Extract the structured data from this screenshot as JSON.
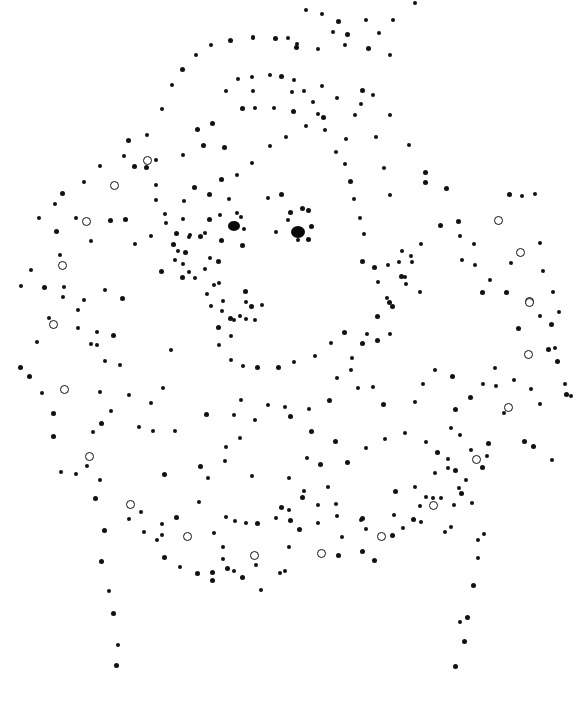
{
  "image": {
    "subject": "dot-art portrait with ruff collar",
    "background": "#fefefe",
    "ink": "#111111",
    "eyes": [
      {
        "x": 228,
        "y": 221,
        "w": 12,
        "h": 10
      },
      {
        "x": 291,
        "y": 226,
        "w": 14,
        "h": 12
      }
    ],
    "rings": [
      [
        147,
        160
      ],
      [
        114,
        185
      ],
      [
        86,
        221
      ],
      [
        62,
        265
      ],
      [
        53,
        324
      ],
      [
        64,
        389
      ],
      [
        89,
        456
      ],
      [
        130,
        504
      ],
      [
        187,
        536
      ],
      [
        254,
        555
      ],
      [
        321,
        553
      ],
      [
        381,
        536
      ],
      [
        433,
        505
      ],
      [
        476,
        459
      ],
      [
        508,
        407
      ],
      [
        528,
        354
      ],
      [
        529,
        301
      ],
      [
        529,
        302
      ],
      [
        520,
        252
      ],
      [
        498,
        220
      ]
    ],
    "dots": [
      [
        415,
        3
      ],
      [
        306,
        10
      ],
      [
        322,
        14
      ],
      [
        338,
        21
      ],
      [
        366,
        20
      ],
      [
        393,
        20
      ],
      [
        253,
        37
      ],
      [
        288,
        38
      ],
      [
        333,
        32
      ],
      [
        347,
        34
      ],
      [
        379,
        33
      ],
      [
        296,
        47
      ],
      [
        318,
        49
      ],
      [
        345,
        45
      ],
      [
        368,
        48
      ],
      [
        390,
        55
      ],
      [
        211,
        45
      ],
      [
        230,
        40
      ],
      [
        253,
        38
      ],
      [
        275,
        38
      ],
      [
        297,
        44
      ],
      [
        196,
        55
      ],
      [
        182,
        69
      ],
      [
        172,
        85
      ],
      [
        162,
        109
      ],
      [
        147,
        135
      ],
      [
        128,
        140
      ],
      [
        124,
        156
      ],
      [
        100,
        166
      ],
      [
        84,
        182
      ],
      [
        62,
        193
      ],
      [
        55,
        204
      ],
      [
        39,
        218
      ],
      [
        238,
        79
      ],
      [
        252,
        77
      ],
      [
        270,
        75
      ],
      [
        281,
        76
      ],
      [
        294,
        80
      ],
      [
        226,
        91
      ],
      [
        253,
        91
      ],
      [
        292,
        92
      ],
      [
        304,
        91
      ],
      [
        322,
        86
      ],
      [
        337,
        98
      ],
      [
        362,
        90
      ],
      [
        373,
        95
      ],
      [
        390,
        115
      ],
      [
        409,
        145
      ],
      [
        425,
        172
      ],
      [
        446,
        188
      ],
      [
        458,
        221
      ],
      [
        474,
        244
      ],
      [
        475,
        265
      ],
      [
        482,
        292
      ],
      [
        197,
        129
      ],
      [
        212,
        123
      ],
      [
        242,
        108
      ],
      [
        255,
        108
      ],
      [
        274,
        108
      ],
      [
        293,
        111
      ],
      [
        313,
        102
      ],
      [
        318,
        114
      ],
      [
        355,
        115
      ],
      [
        361,
        104
      ],
      [
        306,
        126
      ],
      [
        346,
        139
      ],
      [
        376,
        137
      ],
      [
        384,
        168
      ],
      [
        390,
        195
      ],
      [
        425,
        182
      ],
      [
        402,
        251
      ],
      [
        406,
        284
      ],
      [
        387,
        298
      ],
      [
        377,
        340
      ],
      [
        224,
        147
      ],
      [
        203,
        145
      ],
      [
        183,
        155
      ],
      [
        156,
        160
      ],
      [
        146,
        167
      ],
      [
        134,
        166
      ],
      [
        156,
        185
      ],
      [
        194,
        187
      ],
      [
        221,
        179
      ],
      [
        156,
        200
      ],
      [
        184,
        201
      ],
      [
        183,
        219
      ],
      [
        165,
        214
      ],
      [
        209,
        194
      ],
      [
        176,
        233
      ],
      [
        209,
        219
      ],
      [
        237,
        213
      ],
      [
        241,
        217
      ],
      [
        244,
        229
      ],
      [
        242,
        245
      ],
      [
        268,
        198
      ],
      [
        281,
        194
      ],
      [
        290,
        212
      ],
      [
        308,
        210
      ],
      [
        302,
        208
      ],
      [
        311,
        226
      ],
      [
        308,
        239
      ],
      [
        298,
        240
      ],
      [
        276,
        232
      ],
      [
        288,
        220
      ],
      [
        76,
        218
      ],
      [
        91,
        241
      ],
      [
        110,
        220
      ],
      [
        125,
        219
      ],
      [
        135,
        244
      ],
      [
        151,
        236
      ],
      [
        166,
        223
      ],
      [
        190,
        235
      ],
      [
        60,
        255
      ],
      [
        56,
        231
      ],
      [
        21,
        286
      ],
      [
        31,
        270
      ],
      [
        44,
        287
      ],
      [
        63,
        297
      ],
      [
        78,
        310
      ],
      [
        84,
        300
      ],
      [
        78,
        328
      ],
      [
        91,
        344
      ],
      [
        122,
        298
      ],
      [
        161,
        271
      ],
      [
        183,
        264
      ],
      [
        200,
        236
      ],
      [
        175,
        260
      ],
      [
        178,
        251
      ],
      [
        185,
        252
      ],
      [
        189,
        237
      ],
      [
        173,
        244
      ],
      [
        205,
        233
      ],
      [
        189,
        272
      ],
      [
        182,
        277
      ],
      [
        205,
        269
      ],
      [
        195,
        278
      ],
      [
        210,
        258
      ],
      [
        214,
        285
      ],
      [
        207,
        294
      ],
      [
        246,
        302
      ],
      [
        251,
        306
      ],
      [
        262,
        305
      ],
      [
        246,
        319
      ],
      [
        240,
        316
      ],
      [
        255,
        320
      ],
      [
        245,
        291
      ],
      [
        230,
        318
      ],
      [
        218,
        327
      ],
      [
        231,
        336
      ],
      [
        219,
        345
      ],
      [
        231,
        360
      ],
      [
        243,
        366
      ],
      [
        257,
        367
      ],
      [
        278,
        367
      ],
      [
        294,
        362
      ],
      [
        315,
        356
      ],
      [
        331,
        343
      ],
      [
        344,
        332
      ],
      [
        367,
        334
      ],
      [
        389,
        302
      ],
      [
        388,
        265
      ],
      [
        399,
        262
      ],
      [
        401,
        276
      ],
      [
        411,
        256
      ],
      [
        412,
        262
      ],
      [
        420,
        292
      ],
      [
        405,
        277
      ],
      [
        421,
        244
      ],
      [
        440,
        225
      ],
      [
        460,
        236
      ],
      [
        509,
        194
      ],
      [
        522,
        196
      ],
      [
        535,
        194
      ],
      [
        462,
        260
      ],
      [
        511,
        263
      ],
      [
        540,
        243
      ],
      [
        543,
        271
      ],
      [
        553,
        292
      ],
      [
        559,
        312
      ],
      [
        555,
        348
      ],
      [
        557,
        361
      ],
      [
        490,
        280
      ],
      [
        506,
        292
      ],
      [
        540,
        316
      ],
      [
        518,
        328
      ],
      [
        551,
        324
      ],
      [
        548,
        349
      ],
      [
        566,
        394
      ],
      [
        571,
        396
      ],
      [
        495,
        368
      ],
      [
        496,
        386
      ],
      [
        514,
        380
      ],
      [
        531,
        389
      ],
      [
        540,
        404
      ],
      [
        504,
        413
      ],
      [
        483,
        384
      ],
      [
        470,
        397
      ],
      [
        460,
        435
      ],
      [
        455,
        470
      ],
      [
        466,
        480
      ],
      [
        437,
        452
      ],
      [
        471,
        450
      ],
      [
        448,
        468
      ],
      [
        459,
        488
      ],
      [
        441,
        498
      ],
      [
        524,
        441
      ],
      [
        533,
        446
      ],
      [
        552,
        460
      ],
      [
        565,
        384
      ],
      [
        426,
        442
      ],
      [
        373,
        387
      ],
      [
        358,
        388
      ],
      [
        329,
        400
      ],
      [
        309,
        409
      ],
      [
        285,
        407
      ],
      [
        268,
        405
      ],
      [
        241,
        400
      ],
      [
        171,
        350
      ],
      [
        163,
        388
      ],
      [
        129,
        395
      ],
      [
        120,
        365
      ],
      [
        97,
        345
      ],
      [
        20,
        367
      ],
      [
        37,
        342
      ],
      [
        49,
        318
      ],
      [
        64,
        287
      ],
      [
        105,
        290
      ],
      [
        97,
        332
      ],
      [
        113,
        335
      ],
      [
        105,
        361
      ],
      [
        100,
        392
      ],
      [
        111,
        411
      ],
      [
        93,
        432
      ],
      [
        101,
        423
      ],
      [
        87,
        466
      ],
      [
        100,
        480
      ],
      [
        53,
        413
      ],
      [
        42,
        393
      ],
      [
        29,
        376
      ],
      [
        53,
        436
      ],
      [
        61,
        472
      ],
      [
        76,
        474
      ],
      [
        95,
        498
      ],
      [
        104,
        530
      ],
      [
        101,
        561
      ],
      [
        109,
        591
      ],
      [
        113,
        613
      ],
      [
        118,
        645
      ],
      [
        116,
        665
      ],
      [
        129,
        519
      ],
      [
        141,
        512
      ],
      [
        162,
        524
      ],
      [
        176,
        517
      ],
      [
        199,
        502
      ],
      [
        162,
        535
      ],
      [
        157,
        540
      ],
      [
        144,
        532
      ],
      [
        164,
        557
      ],
      [
        180,
        567
      ],
      [
        197,
        573
      ],
      [
        223,
        559
      ],
      [
        227,
        568
      ],
      [
        223,
        547
      ],
      [
        214,
        533
      ],
      [
        226,
        517
      ],
      [
        235,
        521
      ],
      [
        246,
        523
      ],
      [
        257,
        523
      ],
      [
        276,
        518
      ],
      [
        289,
        510
      ],
      [
        290,
        520
      ],
      [
        289,
        547
      ],
      [
        299,
        529
      ],
      [
        280,
        573
      ],
      [
        285,
        571
      ],
      [
        261,
        590
      ],
      [
        256,
        565
      ],
      [
        234,
        571
      ],
      [
        212,
        572
      ],
      [
        212,
        580
      ],
      [
        242,
        577
      ],
      [
        318,
        523
      ],
      [
        336,
        504
      ],
      [
        337,
        516
      ],
      [
        361,
        520
      ],
      [
        362,
        518
      ],
      [
        366,
        529
      ],
      [
        342,
        537
      ],
      [
        338,
        555
      ],
      [
        362,
        551
      ],
      [
        374,
        560
      ],
      [
        403,
        528
      ],
      [
        413,
        519
      ],
      [
        454,
        505
      ],
      [
        461,
        493
      ],
      [
        482,
        467
      ],
      [
        487,
        456
      ],
      [
        488,
        443
      ],
      [
        448,
        459
      ],
      [
        472,
        503
      ],
      [
        484,
        534
      ],
      [
        478,
        540
      ],
      [
        473,
        585
      ],
      [
        478,
        558
      ],
      [
        467,
        617
      ],
      [
        464,
        641
      ],
      [
        455,
        666
      ],
      [
        460,
        622
      ],
      [
        445,
        532
      ],
      [
        451,
        527
      ],
      [
        421,
        522
      ],
      [
        392,
        535
      ],
      [
        394,
        515
      ],
      [
        395,
        491
      ],
      [
        415,
        487
      ],
      [
        420,
        506
      ],
      [
        426,
        497
      ],
      [
        435,
        473
      ],
      [
        433,
        498
      ],
      [
        415,
        402
      ],
      [
        423,
        384
      ],
      [
        435,
        370
      ],
      [
        452,
        376
      ],
      [
        455,
        409
      ],
      [
        451,
        428
      ],
      [
        405,
        433
      ],
      [
        385,
        439
      ],
      [
        366,
        448
      ],
      [
        347,
        462
      ],
      [
        328,
        487
      ],
      [
        304,
        491
      ],
      [
        281,
        507
      ],
      [
        302,
        497
      ],
      [
        318,
        505
      ],
      [
        320,
        464
      ],
      [
        335,
        441
      ],
      [
        311,
        431
      ],
      [
        290,
        416
      ],
      [
        255,
        420
      ],
      [
        234,
        415
      ],
      [
        206,
        414
      ],
      [
        175,
        431
      ],
      [
        153,
        431
      ],
      [
        151,
        403
      ],
      [
        139,
        427
      ],
      [
        164,
        474
      ],
      [
        200,
        466
      ],
      [
        240,
        438
      ],
      [
        226,
        447
      ],
      [
        225,
        461
      ],
      [
        208,
        478
      ],
      [
        252,
        476
      ],
      [
        289,
        478
      ],
      [
        307,
        458
      ],
      [
        383,
        404
      ],
      [
        362,
        343
      ],
      [
        352,
        358
      ],
      [
        351,
        370
      ],
      [
        337,
        378
      ],
      [
        390,
        334
      ],
      [
        377,
        316
      ],
      [
        392,
        306
      ],
      [
        378,
        282
      ],
      [
        374,
        267
      ],
      [
        362,
        261
      ],
      [
        364,
        234
      ],
      [
        360,
        218
      ],
      [
        354,
        199
      ],
      [
        350,
        181
      ],
      [
        345,
        164
      ],
      [
        336,
        152
      ],
      [
        325,
        130
      ],
      [
        323,
        117
      ],
      [
        286,
        137
      ],
      [
        270,
        146
      ],
      [
        252,
        163
      ],
      [
        237,
        175
      ],
      [
        229,
        199
      ],
      [
        220,
        215
      ],
      [
        221,
        240
      ],
      [
        218,
        261
      ],
      [
        219,
        283
      ],
      [
        223,
        301
      ],
      [
        234,
        320
      ],
      [
        222,
        311
      ],
      [
        211,
        306
      ]
    ]
  }
}
